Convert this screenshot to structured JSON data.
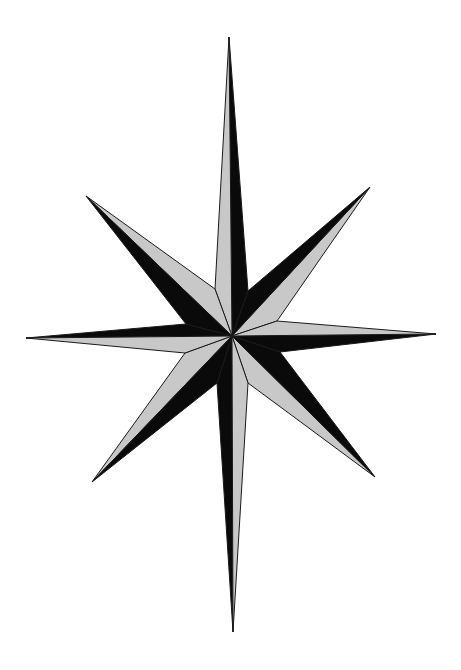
{
  "image": {
    "subject": "eight-pointed compass star",
    "style": "black and light-gray faceted line art on white background"
  },
  "colors": {
    "background": "#ffffff",
    "light_facet": "#c8c8c8",
    "dark_facet": "#0a0a0a",
    "outline": "#1a1a1a"
  },
  "rays": [
    {
      "name": "north",
      "dark_side": "east"
    },
    {
      "name": "north-east",
      "dark_side": "north-west"
    },
    {
      "name": "east",
      "dark_side": "south"
    },
    {
      "name": "south-east",
      "dark_side": "north-east"
    },
    {
      "name": "south",
      "dark_side": "west"
    },
    {
      "name": "south-west",
      "dark_side": "south-east"
    },
    {
      "name": "west",
      "dark_side": "north"
    },
    {
      "name": "north-west",
      "dark_side": "south-west"
    }
  ]
}
